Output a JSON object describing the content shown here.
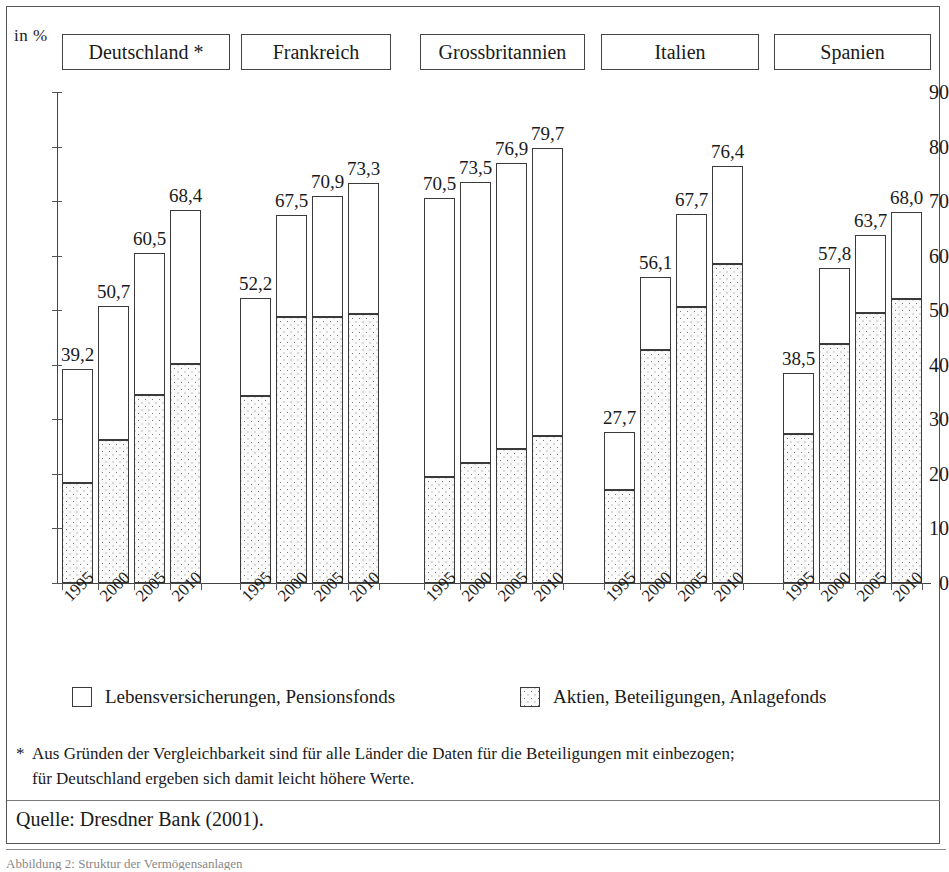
{
  "axis_unit_label": "in %",
  "country_headers": [
    {
      "label": "Deutschland *"
    },
    {
      "label": "Frankreich"
    },
    {
      "label": "Grossbritannien"
    },
    {
      "label": "Italien"
    },
    {
      "label": "Spanien"
    }
  ],
  "legend": [
    {
      "label": "Lebensversicherungen, Pensionsfonds",
      "swatch": "white-square-icon"
    },
    {
      "label": "Aktien, Beteiligungen, Anlagefonds",
      "swatch": "dotted-square-icon"
    }
  ],
  "footnote": {
    "marker": "*",
    "line1": "Aus Gründen der Vergleichbarkeit sind für alle Länder die Daten für die Beteiligungen mit einbezogen;",
    "line2": "für Deutschland ergeben sich damit leicht höhere Werte."
  },
  "source": "Quelle: Dresdner Bank (2001).",
  "caption": "Abbildung 2:  Struktur der Vermögensanlagen",
  "chart_data": {
    "type": "bar",
    "title": "",
    "subtitle": "",
    "xlabel": "",
    "ylabel": "in %",
    "ylim": [
      0,
      90
    ],
    "yticks": [
      0,
      10,
      20,
      30,
      40,
      50,
      60,
      70,
      80,
      90
    ],
    "ytick_labels": [
      "0",
      "10",
      "20",
      "30",
      "40",
      "50",
      "60",
      "70",
      "80",
      "90"
    ],
    "grid": false,
    "stacked": true,
    "legend_position": "bottom",
    "categories": [
      "1995",
      "2000",
      "2005",
      "2010"
    ],
    "groups": [
      "Deutschland *",
      "Frankreich",
      "Grossbritannien",
      "Italien",
      "Spanien"
    ],
    "series": [
      {
        "name": "Aktien, Beteiligungen, Anlagefonds",
        "fill": "dotted",
        "values_by_group": {
          "Deutschland *": [
            18.4,
            26.3,
            34.5,
            40.2
          ],
          "Frankreich": [
            34.3,
            48.7,
            48.8,
            49.3
          ],
          "Grossbritannien": [
            19.5,
            22.0,
            24.5,
            27.0
          ],
          "Italien": [
            17.0,
            42.8,
            50.6,
            58.5
          ],
          "Spanien": [
            27.3,
            43.9,
            49.4,
            52.0
          ]
        }
      },
      {
        "name": "Lebensversicherungen, Pensionsfonds",
        "fill": "white",
        "values_by_group": {
          "Deutschland *": [
            20.8,
            24.4,
            26.0,
            28.2
          ],
          "Frankreich": [
            17.9,
            18.8,
            22.1,
            24.0
          ],
          "Grossbritannien": [
            51.0,
            51.5,
            52.4,
            52.7
          ],
          "Italien": [
            10.7,
            13.3,
            17.1,
            17.9
          ],
          "Spanien": [
            11.2,
            13.9,
            14.3,
            16.0
          ]
        }
      }
    ],
    "totals_by_group": {
      "Deutschland *": [
        39.2,
        50.7,
        60.5,
        68.4
      ],
      "Frankreich": [
        52.2,
        67.5,
        70.9,
        73.3
      ],
      "Grossbritannien": [
        70.5,
        73.5,
        76.9,
        79.7
      ],
      "Italien": [
        27.7,
        56.1,
        67.7,
        76.4
      ],
      "Spanien": [
        38.5,
        57.8,
        63.7,
        68.0
      ]
    },
    "total_labels_by_group": {
      "Deutschland *": [
        "39,2",
        "50,7",
        "60,5",
        "68,4"
      ],
      "Frankreich": [
        "52,2",
        "67,5",
        "70,9",
        "73,3"
      ],
      "Grossbritannien": [
        "70,5",
        "73,5",
        "76,9",
        "79,7"
      ],
      "Italien": [
        "27,7",
        "56,1",
        "67,7",
        "76,4"
      ],
      "Spanien": [
        "38,5",
        "57,8",
        "63,7",
        "68,0"
      ]
    }
  }
}
